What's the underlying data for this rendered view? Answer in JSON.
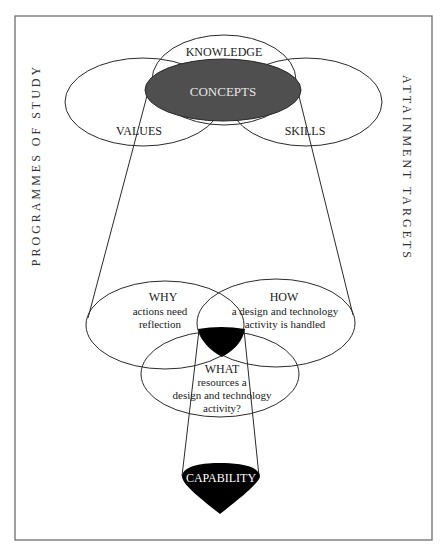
{
  "side_labels": {
    "left": "PROGRAMMES OF STUDY",
    "right": "ATTAINMENT TARGETS"
  },
  "top_cluster": {
    "knowledge": "KNOWLEDGE",
    "concepts": "CONCEPTS",
    "values": "VALUES",
    "skills": "SKILLS"
  },
  "bottom_cluster": {
    "why": {
      "title": "WHY",
      "line1": "actions need",
      "line2": "reflection"
    },
    "how": {
      "title": "HOW",
      "line1": "a design and technology",
      "line2": "activity is handled"
    },
    "what": {
      "title": "WHAT",
      "line1": "resources a",
      "line2": "design and technology",
      "line3": "activity?"
    }
  },
  "result": {
    "label": "CAPABILITY"
  },
  "colors": {
    "frame": "#6e6e6e",
    "line": "#2a2a2a",
    "concepts_fill": "#4f4f4f",
    "black_fill": "#000000",
    "concepts_text": "#e6e6e6",
    "capability_text": "#ffffff"
  }
}
